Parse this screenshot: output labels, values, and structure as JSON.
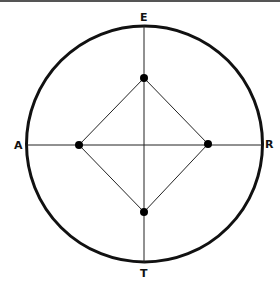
{
  "diagram": {
    "labels": {
      "top": "E",
      "bottom": "T",
      "left": "A",
      "right": "R"
    },
    "circle": {
      "cx": 144.5,
      "cy": 144,
      "r": 118,
      "stroke": "#111111",
      "stroke_width": 3
    },
    "axes": {
      "vertical": {
        "x": 144,
        "y1": 25,
        "y2": 263
      },
      "horizontal": {
        "y": 145,
        "x1": 27,
        "x2": 262
      }
    },
    "points": [
      {
        "id": "top",
        "x": 144,
        "y": 78
      },
      {
        "id": "right",
        "x": 208,
        "y": 144
      },
      {
        "id": "bottom",
        "x": 144,
        "y": 212
      },
      {
        "id": "left",
        "x": 79,
        "y": 145
      }
    ],
    "colors": {
      "line": "#222222",
      "dot": "#000000",
      "frame": "#555555"
    }
  }
}
